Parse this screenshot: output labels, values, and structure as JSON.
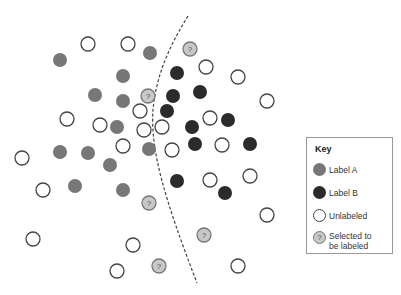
{
  "colors": {
    "label_a": "#777777",
    "label_b": "#2b2b2b",
    "unlabeled_fill": "#ffffff",
    "unlabeled_stroke": "#444444",
    "selected_fill": "#c8c8c8",
    "selected_stroke": "#777777",
    "boundary": "#444444"
  },
  "key": {
    "title": "Key",
    "items": [
      {
        "type": "label_a",
        "label": "Label A"
      },
      {
        "type": "label_b",
        "label": "Label B"
      },
      {
        "type": "unlabeled",
        "label": "Unlabeled"
      },
      {
        "type": "selected",
        "label": "Selected to be labeled",
        "glyph": "?"
      }
    ]
  },
  "points": {
    "label_a": [
      [
        60,
        60
      ],
      [
        150,
        53
      ],
      [
        123,
        76
      ],
      [
        95,
        95
      ],
      [
        123,
        101
      ],
      [
        117,
        127
      ],
      [
        60,
        152
      ],
      [
        88,
        153
      ],
      [
        110,
        165
      ],
      [
        149,
        149
      ],
      [
        75,
        186
      ],
      [
        123,
        190
      ]
    ],
    "label_b": [
      [
        177,
        73
      ],
      [
        200,
        92
      ],
      [
        173,
        96
      ],
      [
        167,
        111
      ],
      [
        192,
        127
      ],
      [
        228,
        120
      ],
      [
        195,
        144
      ],
      [
        250,
        144
      ],
      [
        177,
        181
      ],
      [
        225,
        193
      ]
    ],
    "unlabeled": [
      [
        88,
        44
      ],
      [
        128,
        44
      ],
      [
        206,
        67
      ],
      [
        238,
        77
      ],
      [
        267,
        101
      ],
      [
        140,
        111
      ],
      [
        67,
        119
      ],
      [
        100,
        125
      ],
      [
        144,
        130
      ],
      [
        162,
        127
      ],
      [
        210,
        118
      ],
      [
        123,
        146
      ],
      [
        172,
        150
      ],
      [
        222,
        145
      ],
      [
        22,
        158
      ],
      [
        43,
        190
      ],
      [
        210,
        180
      ],
      [
        250,
        176
      ],
      [
        267,
        215
      ],
      [
        33,
        239
      ],
      [
        133,
        245
      ],
      [
        117,
        271
      ],
      [
        238,
        266
      ]
    ],
    "selected": [
      [
        190,
        49
      ],
      [
        148,
        96
      ],
      [
        149,
        203
      ],
      [
        204,
        235
      ],
      [
        159,
        266
      ]
    ]
  },
  "selected_glyph": "?",
  "boundary_path": "M188,16 C170,45 156,75 153,110 C150,150 165,200 197,283"
}
